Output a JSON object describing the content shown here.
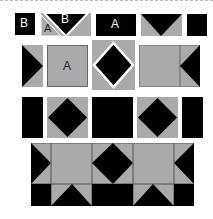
{
  "labels": {
    "b1": "B",
    "a1": "A",
    "b2": "B",
    "a2": "A",
    "a3": "A"
  },
  "colors": {
    "black": "#000000",
    "gray": "#aaaaaa",
    "line": "#666666",
    "white": "#ffffff"
  },
  "rows": [
    {
      "name": "row-1",
      "tiles": [
        "black-square-B",
        "triangle-tile-AB",
        "black-rect-A",
        "v-tile",
        "black-square"
      ]
    },
    {
      "name": "row-2",
      "tiles": [
        "right-triangle-tile",
        "gray-square-A",
        "diamond-tile-outlined",
        "left-triangle-tile"
      ]
    },
    {
      "name": "row-3",
      "tiles": [
        "black-rect",
        "gray-diamond",
        "black-square",
        "gray-diamond",
        "black-rect"
      ]
    },
    {
      "name": "row-4",
      "tiles": [
        "quilt-block-assembled"
      ]
    }
  ]
}
